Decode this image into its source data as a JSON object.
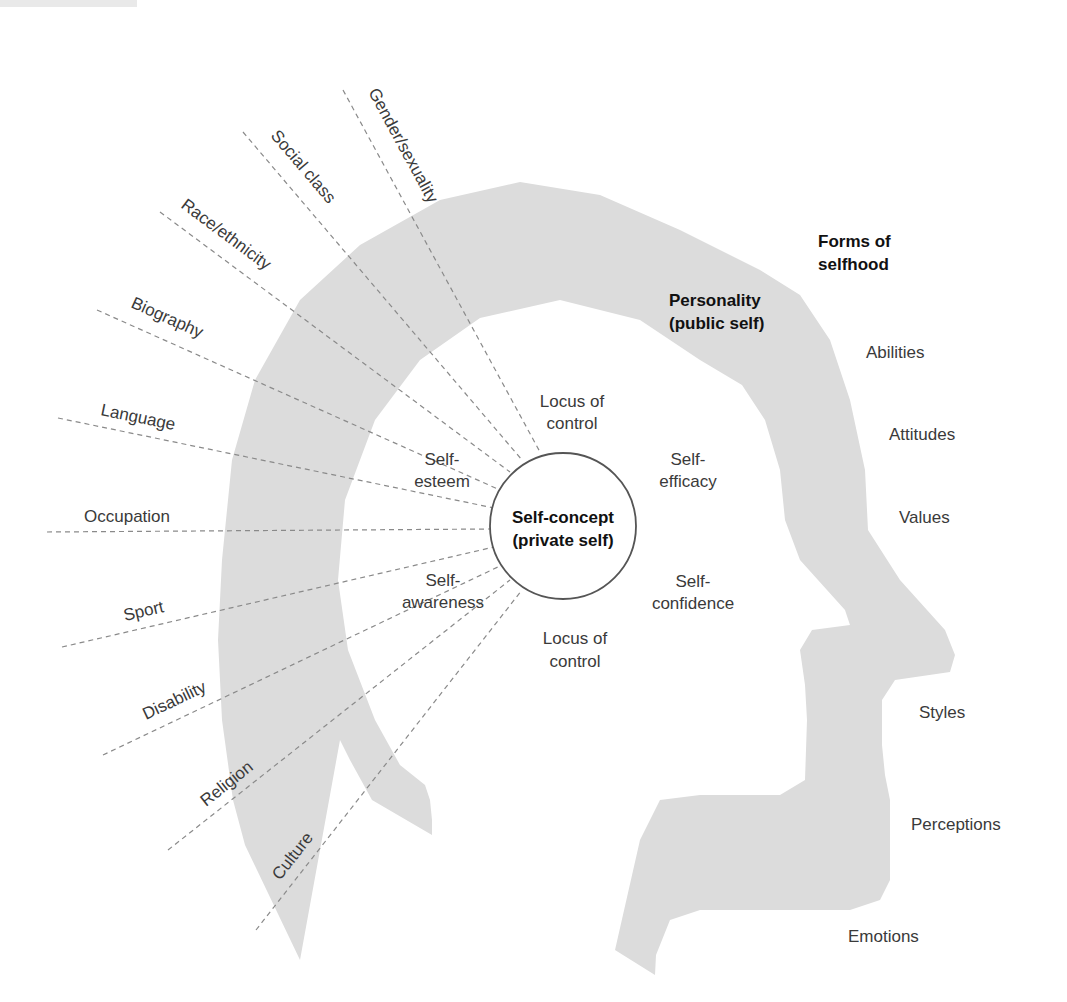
{
  "colors": {
    "head_fill": "#dcdcdc",
    "line": "#8a8a8a",
    "text": "#3a3a3a",
    "text_bold": "#111111",
    "circle_stroke": "#555555"
  },
  "center": {
    "title_line1": "Self-concept",
    "title_line2": "(private self)"
  },
  "band": {
    "title_line1": "Personality",
    "title_line2": "(public self)"
  },
  "forms": {
    "title_line1": "Forms of",
    "title_line2": "selfhood",
    "items": [
      "Abilities",
      "Attitudes",
      "Values",
      "Styles",
      "Perceptions",
      "Emotions"
    ]
  },
  "inner": {
    "locus_top_1": "Locus of",
    "locus_top_2": "control",
    "efficacy_1": "Self-",
    "efficacy_2": "efficacy",
    "esteem_1": "Self-",
    "esteem_2": "esteem",
    "awareness_1": "Self-",
    "awareness_2": "awareness",
    "confidence_1": "Self-",
    "confidence_2": "confidence",
    "locus_bottom_1": "Locus of",
    "locus_bottom_2": "control"
  },
  "influences": [
    "Gender/sexuality",
    "Social class",
    "Race/ethnicity",
    "Biography",
    "Language",
    "Occupation",
    "Sport",
    "Disability",
    "Religion",
    "Culture"
  ]
}
